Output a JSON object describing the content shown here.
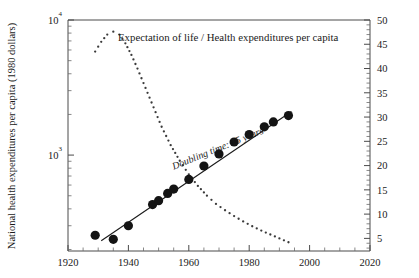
{
  "figure": {
    "background": "#ffffff",
    "ink": "#1a1a1a"
  },
  "chart_data": {
    "type": "scatter",
    "title": "Expectation of life / Health expenditures per capita",
    "xlabel": "",
    "ylabel": "National health expenditures per capita (1980 dollars)",
    "y2label": "",
    "xlim": [
      1920,
      2020
    ],
    "xticks": [
      1920,
      1940,
      1960,
      1980,
      2000,
      2020
    ],
    "xticklabels": [
      "1920",
      "1940",
      "1960",
      "1980",
      "2000",
      "2020"
    ],
    "xminor_step": 5,
    "yscale": "log",
    "ylim": [
      195,
      10000
    ],
    "yticks": [
      1000,
      10000
    ],
    "yticklabels": [
      "10³",
      "10⁴"
    ],
    "y2lim": [
      2.4,
      50
    ],
    "y2ticks": [
      5,
      10,
      15,
      20,
      25,
      30,
      35,
      40,
      45,
      50
    ],
    "y2ticklabels": [
      "5",
      "10",
      "15",
      "20",
      "25",
      "30",
      "35",
      "40",
      "45",
      "50"
    ],
    "y2minor_step": 1,
    "grid": false,
    "legend": "none",
    "annotations": [
      {
        "text": "Doubling time: 15 years",
        "x": 1955,
        "y": 780,
        "rotation": -22,
        "style": "italic"
      }
    ],
    "series": [
      {
        "name": "Health expenditures per capita (1980 dollars)",
        "type": "scatter",
        "marker": "filled-circle",
        "color": "#141414",
        "axis": "left",
        "points": [
          {
            "x": 1929,
            "y": 255
          },
          {
            "x": 1935,
            "y": 238
          },
          {
            "x": 1940,
            "y": 300
          },
          {
            "x": 1948,
            "y": 430
          },
          {
            "x": 1950,
            "y": 460
          },
          {
            "x": 1953,
            "y": 520
          },
          {
            "x": 1955,
            "y": 560
          },
          {
            "x": 1960,
            "y": 660
          },
          {
            "x": 1965,
            "y": 830
          },
          {
            "x": 1970,
            "y": 1020
          },
          {
            "x": 1975,
            "y": 1250
          },
          {
            "x": 1980,
            "y": 1420
          },
          {
            "x": 1985,
            "y": 1620
          },
          {
            "x": 1988,
            "y": 1760
          },
          {
            "x": 1993,
            "y": 1960
          }
        ]
      },
      {
        "name": "Doubling-time fit line",
        "type": "line",
        "color": "#1a1a1a",
        "axis": "left",
        "doubling_time_years": 15,
        "endpoints": [
          {
            "x": 1931,
            "y": 232
          },
          {
            "x": 1994,
            "y": 2100
          }
        ]
      },
      {
        "name": "Expectation of life",
        "type": "dotted-curve",
        "marker": "small-dot",
        "color": "#3a3a3a",
        "axis": "right",
        "points": [
          {
            "x": 1929,
            "y": 43.5
          },
          {
            "x": 1931,
            "y": 45.5
          },
          {
            "x": 1933,
            "y": 47.0
          },
          {
            "x": 1935,
            "y": 47.6
          },
          {
            "x": 1937,
            "y": 47.0
          },
          {
            "x": 1939,
            "y": 45.2
          },
          {
            "x": 1941,
            "y": 42.8
          },
          {
            "x": 1943,
            "y": 40.0
          },
          {
            "x": 1945,
            "y": 37.0
          },
          {
            "x": 1947,
            "y": 34.0
          },
          {
            "x": 1949,
            "y": 31.0
          },
          {
            "x": 1951,
            "y": 28.0
          },
          {
            "x": 1954,
            "y": 24.2
          },
          {
            "x": 1957,
            "y": 21.0
          },
          {
            "x": 1960,
            "y": 18.2
          },
          {
            "x": 1963,
            "y": 15.8
          },
          {
            "x": 1966,
            "y": 13.8
          },
          {
            "x": 1969,
            "y": 12.1
          },
          {
            "x": 1972,
            "y": 10.8
          },
          {
            "x": 1975,
            "y": 9.6
          },
          {
            "x": 1978,
            "y": 8.5
          },
          {
            "x": 1981,
            "y": 7.5
          },
          {
            "x": 1984,
            "y": 6.6
          },
          {
            "x": 1987,
            "y": 5.8
          },
          {
            "x": 1990,
            "y": 5.0
          },
          {
            "x": 1993,
            "y": 4.2
          }
        ]
      }
    ]
  }
}
